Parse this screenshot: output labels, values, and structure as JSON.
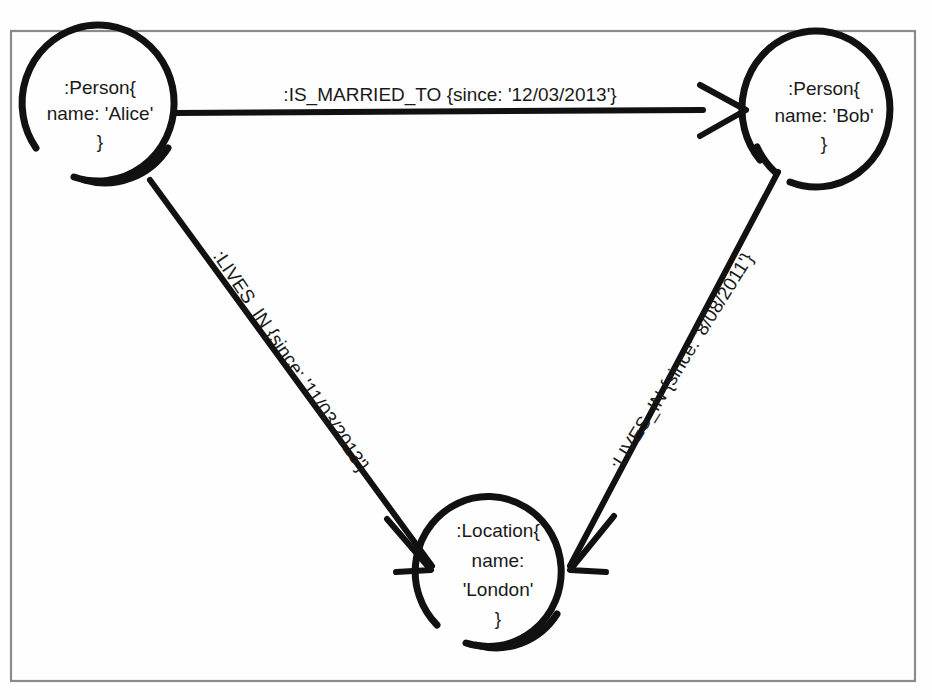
{
  "canvas": {
    "width": 932,
    "height": 700,
    "background_color": "#fefefe",
    "frame_color": "#8a8a8a",
    "ink_color": "#111111"
  },
  "nodes": [
    {
      "id": "alice",
      "name": "node-person-alice",
      "cx": 100,
      "cy": 110,
      "r": 75,
      "lines": [
        ":Person{",
        "name: 'Alice'",
        "}"
      ]
    },
    {
      "id": "bob",
      "name": "node-person-bob",
      "cx": 823,
      "cy": 112,
      "r": 73,
      "lines": [
        ":Person{",
        "name: 'Bob'",
        "}"
      ]
    },
    {
      "id": "london",
      "name": "node-location-london",
      "cx": 498,
      "cy": 570,
      "r": 73,
      "lines": [
        ":Location{",
        "name:",
        "'London'",
        "}"
      ]
    }
  ],
  "edges": [
    {
      "id": "married",
      "name": "edge-is-married-to",
      "type": ":IS_MARRIED_TO",
      "since": "12/03/2013",
      "label": ":IS_MARRIED_TO {since: '12/03/2013'}",
      "from": "alice",
      "to": "bob",
      "label_x": 450,
      "label_y": 96,
      "label_rotation": 0
    },
    {
      "id": "alice_lives_in",
      "name": "edge-alice-lives-in-london",
      "type": ":LIVES_IN",
      "since": "11/03/2013",
      "label": ":LIVES_IN {since: '11/03/2013'}",
      "from": "alice",
      "to": "london",
      "label_x": 290,
      "label_y": 362,
      "label_rotation": 56
    },
    {
      "id": "bob_lives_in",
      "name": "edge-bob-lives-in-london",
      "type": ":LIVES_IN",
      "since": "8/08/2011",
      "label": ":LIVES_IN {since: '8/08/2011'}",
      "from": "bob",
      "to": "london",
      "label_x": 683,
      "label_y": 362,
      "label_rotation": -58
    }
  ]
}
